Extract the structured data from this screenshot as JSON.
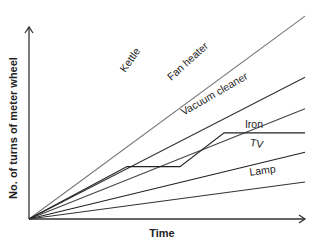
{
  "chart_data": {
    "type": "line",
    "title": "",
    "xlabel": "Time",
    "ylabel": "No. of turns of meter wheel",
    "grid": false,
    "legend": "inline labels",
    "axis": {
      "origin": [
        29,
        219
      ],
      "x_end": 305,
      "y_end": 27,
      "color": "#333333"
    },
    "series": [
      {
        "name": "Kettle",
        "color": "#777777",
        "points": [
          [
            0,
            0
          ],
          [
            100,
            103
          ]
        ],
        "label_pos": [
          133,
          62
        ],
        "label_angle": -55
      },
      {
        "name": "Fan heater",
        "color": "#333333",
        "points": [
          [
            0,
            0
          ],
          [
            100,
            72
          ]
        ],
        "label_pos": [
          190,
          64
        ],
        "label_angle": -42
      },
      {
        "name": "Vacuum cleaner",
        "color": "#444444",
        "points": [
          [
            0,
            0
          ],
          [
            100,
            56
          ]
        ],
        "label_pos": [
          216,
          97
        ],
        "label_angle": -30
      },
      {
        "name": "Iron",
        "color": "#222222",
        "points": [
          [
            0,
            0
          ],
          [
            35.5,
            26.6
          ],
          [
            54.7,
            26.6
          ],
          [
            70.7,
            43.7
          ],
          [
            100,
            43.7
          ]
        ],
        "label_pos": [
          254,
          128
        ],
        "label_angle": 0
      },
      {
        "name": "TV",
        "color": "#222222",
        "points": [
          [
            0,
            0
          ],
          [
            100,
            33.9
          ]
        ],
        "label_pos": [
          256,
          147
        ],
        "label_angle": 10
      },
      {
        "name": "Lamp",
        "color": "#333333",
        "points": [
          [
            0,
            0
          ],
          [
            100,
            18.8
          ]
        ],
        "label_pos": [
          263,
          174
        ],
        "label_angle": -8
      }
    ],
    "xlim": [
      0,
      100
    ],
    "ylim": [
      0,
      100
    ],
    "note": "Qualitative chart: no tick values shown; coordinates are relative (% of axis length)."
  }
}
